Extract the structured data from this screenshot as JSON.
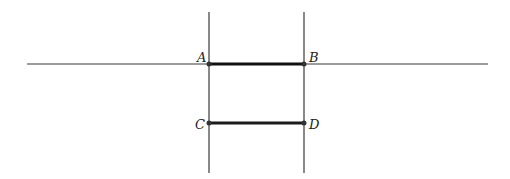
{
  "diagram": {
    "points": {
      "A": {
        "label": "A",
        "x": 209,
        "y": 64
      },
      "B": {
        "label": "B",
        "x": 304,
        "y": 64
      },
      "C": {
        "label": "C",
        "x": 209,
        "y": 123
      },
      "D": {
        "label": "D",
        "x": 304,
        "y": 123
      }
    },
    "lines": [
      {
        "name": "horizontal-line",
        "x1": 27,
        "y1": 64,
        "x2": 488,
        "y2": 64
      },
      {
        "name": "vertical-line-left",
        "x1": 209,
        "y1": 12,
        "x2": 209,
        "y2": 173
      },
      {
        "name": "vertical-line-right",
        "x1": 304,
        "y1": 12,
        "x2": 304,
        "y2": 173
      }
    ],
    "segments": [
      {
        "name": "segment-AB",
        "from": "A",
        "to": "B"
      },
      {
        "name": "segment-CD",
        "from": "C",
        "to": "D"
      }
    ],
    "colors": {
      "line": "#333333",
      "segment": "#1a1a1a",
      "point": "#222222"
    }
  }
}
